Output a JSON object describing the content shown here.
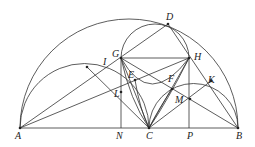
{
  "diagram": {
    "type": "geometry",
    "points": {
      "A": [
        20,
        128
      ],
      "B": [
        238,
        128
      ],
      "N": [
        121,
        128
      ],
      "C": [
        149,
        128
      ],
      "P": [
        189,
        128
      ],
      "G": [
        121,
        58
      ],
      "H": [
        189,
        58
      ],
      "D": [
        168,
        24
      ],
      "I": [
        87,
        67
      ],
      "E": [
        135,
        80
      ],
      "F": [
        172,
        89
      ],
      "K": [
        211,
        81
      ],
      "M": [
        190,
        99
      ],
      "L": [
        121,
        92
      ]
    },
    "labels": [
      {
        "text": "A",
        "x": 15,
        "y": 131
      },
      {
        "text": "N",
        "x": 116,
        "y": 131
      },
      {
        "text": "C",
        "x": 146,
        "y": 131
      },
      {
        "text": "P",
        "x": 187,
        "y": 131
      },
      {
        "text": "B",
        "x": 236,
        "y": 131
      },
      {
        "text": "G",
        "x": 112,
        "y": 49
      },
      {
        "text": "H",
        "x": 194,
        "y": 52
      },
      {
        "text": "D",
        "x": 166,
        "y": 12
      },
      {
        "text": "I",
        "x": 103,
        "y": 57
      },
      {
        "text": "E",
        "x": 128,
        "y": 70
      },
      {
        "text": "F",
        "x": 168,
        "y": 74
      },
      {
        "text": "K",
        "x": 208,
        "y": 75
      },
      {
        "text": "M",
        "x": 175,
        "y": 95
      },
      {
        "text": "L",
        "x": 114,
        "y": 89
      }
    ]
  }
}
